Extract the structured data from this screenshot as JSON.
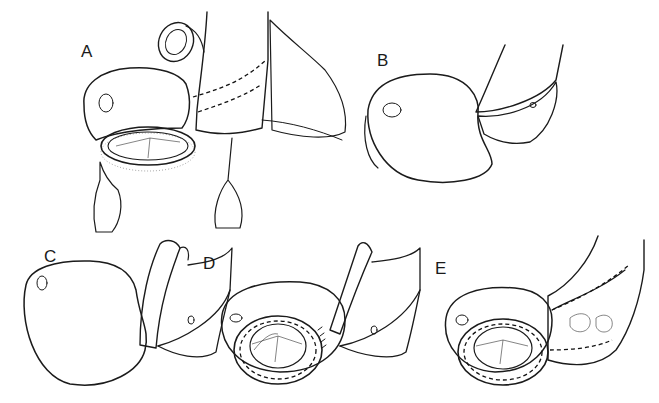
{
  "figure": {
    "type": "surgical illustration",
    "panels": [
      {
        "id": "A",
        "label": "A",
        "description": "Opened heart chamber with prosthetic valve ring and retracted tissue flaps, great vessel with dashed incision line"
      },
      {
        "id": "B",
        "label": "B",
        "description": "Opened chamber with tubular vessel flap folded over"
      },
      {
        "id": "C",
        "label": "C",
        "description": "Chamber with vessel flap reflected upward"
      },
      {
        "id": "D",
        "label": "D",
        "description": "Prosthetic valve ring seated in annulus with interrupted sutures"
      },
      {
        "id": "E",
        "label": "E",
        "description": "Valve seated and vessel patch sutured closed with running sutures"
      }
    ]
  },
  "colors": {
    "ink": "#1b1b1b",
    "background": "#ffffff"
  }
}
